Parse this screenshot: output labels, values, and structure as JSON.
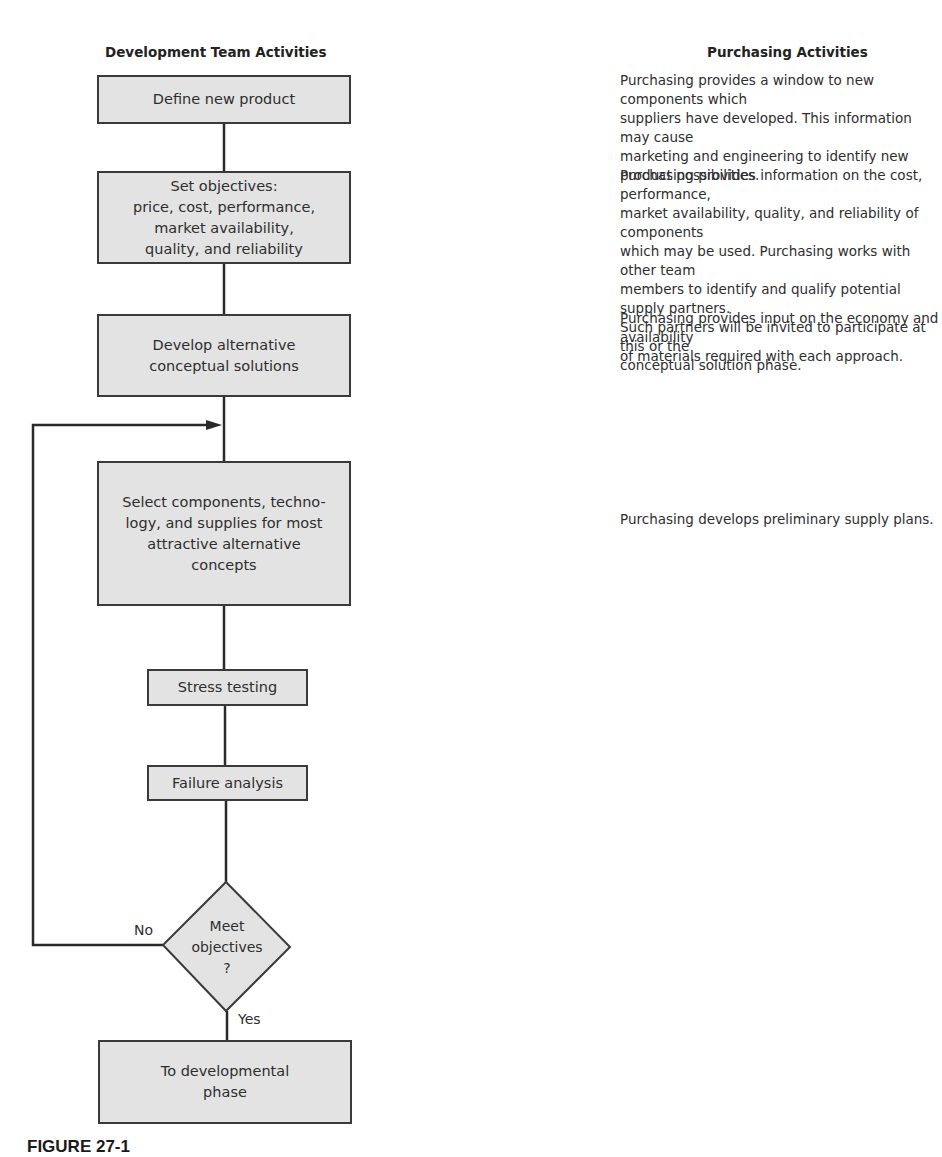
{
  "headers": {
    "left": "Development Team Activities",
    "right": "Purchasing Activities"
  },
  "flow": {
    "define": "Define new product",
    "objectives": "Set objectives:\nprice, cost, performance,\nmarket availability,\nquality, and reliability",
    "develop": "Develop alternative\nconceptual solutions",
    "select": "Select components, techno-\nlogy, and supplies for most\nattractive alternative\nconcepts",
    "stress": "Stress testing",
    "failure": "Failure analysis",
    "decision": "Meet\nobjectives\n?",
    "final": "To developmental\nphase",
    "no_label": "No",
    "yes_label": "Yes"
  },
  "purchasing": [
    "Purchasing provides a window to new components which\nsuppliers have developed.  This information may cause\nmarketing and engineering to identify new product possibilities.",
    "Purchasing provides information on the cost, performance,\nmarket availability, quality, and reliability of components\nwhich may be used.  Purchasing works with other team\nmembers to identify and qualify potential supply partners.\nSuch partners will be invited to participate at this or the\nconceptual solution phase.",
    "Purchasing provides input on the economy and availability\nof materials required with each approach.",
    "Purchasing develops preliminary supply plans."
  ],
  "caption": "FIGURE 27-1",
  "colors": {
    "box_fill": "#e3e3e3",
    "line": "#2a2a2a"
  }
}
